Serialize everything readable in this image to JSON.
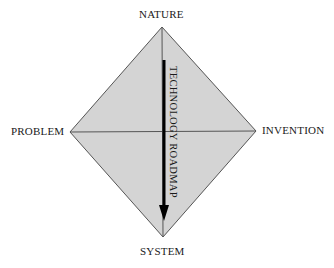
{
  "diagram": {
    "vertices": {
      "top": "NATURE",
      "left": "PROBLEM",
      "right": "INVENTION",
      "bottom": "SYSTEM"
    },
    "arrow_label": "TECHNOLOGY ROADMAP",
    "arrow_direction": "top-to-bottom",
    "colors": {
      "fill": "#d4d4d4",
      "stroke": "#555555",
      "arrow": "#000000"
    }
  }
}
